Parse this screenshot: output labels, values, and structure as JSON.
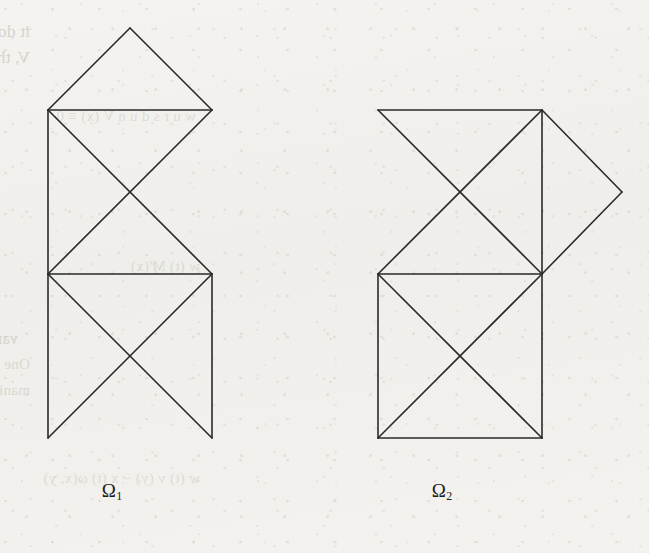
{
  "page": {
    "kind": "scanned-book-page",
    "width": 649,
    "height": 553,
    "paper_color": "#f2f1ee",
    "ink_color": "#2a2a2a",
    "bleedthrough_color": "#b9b5ad"
  },
  "figures": [
    {
      "id": "omega-1",
      "label": "Ω",
      "subscript": "1",
      "label_x": 112,
      "label_y": 480,
      "description": "Vertical strip of two stacked squares with X diagonals, capped by an upward triangle",
      "stroke": "#2a2a2a",
      "stroke_width": 1.6,
      "segments": [
        [
          130,
          28,
          48,
          110
        ],
        [
          130,
          28,
          212,
          110
        ],
        [
          48,
          110,
          212,
          110
        ],
        [
          48,
          110,
          48,
          274
        ],
        [
          48,
          110,
          212,
          274
        ],
        [
          212,
          110,
          48,
          274
        ],
        [
          48,
          274,
          212,
          274
        ],
        [
          48,
          274,
          48,
          438
        ],
        [
          212,
          274,
          212,
          438
        ],
        [
          48,
          274,
          212,
          438
        ],
        [
          212,
          274,
          48,
          438
        ]
      ]
    },
    {
      "id": "omega-2",
      "label": "Ω",
      "subscript": "2",
      "label_x": 442,
      "label_y": 480,
      "description": "Two stacked squares with X diagonals plus a diamond attached on the right of the upper square",
      "stroke": "#2a2a2a",
      "stroke_width": 1.6,
      "segments": [
        [
          378,
          110,
          542,
          110
        ],
        [
          378,
          110,
          542,
          274
        ],
        [
          542,
          110,
          378,
          274
        ],
        [
          542,
          110,
          542,
          274
        ],
        [
          378,
          274,
          542,
          274
        ],
        [
          542,
          110,
          622,
          192
        ],
        [
          622,
          192,
          542,
          274
        ],
        [
          378,
          274,
          378,
          438
        ],
        [
          542,
          274,
          542,
          438
        ],
        [
          378,
          438,
          542,
          438
        ],
        [
          378,
          274,
          542,
          438
        ],
        [
          542,
          274,
          378,
          438
        ]
      ]
    }
  ],
  "bleedthrough": {
    "note": "Faint mirrored show-through text from the reverse side of the sheet; not legible as content.",
    "lines": [
      {
        "text": "it does a bounded value the and its mapping will then",
        "x": 30,
        "y": 22,
        "size": 17,
        "opacity": 0.5
      },
      {
        "text": "V, then Dirichlet representation it then is son in I et",
        "x": 30,
        "y": 48,
        "size": 17,
        "opacity": 0.5
      },
      {
        "text": "w u r s     d u n     V  (x)     ≡     0",
        "x": 196,
        "y": 108,
        "size": 15,
        "opacity": 0.34
      },
      {
        "text": "w (t) M'(x)",
        "x": 200,
        "y": 258,
        "size": 15,
        "opacity": 0.34
      },
      {
        "text": "varies. So the the proceeds of and this the from the whe",
        "x": 18,
        "y": 330,
        "size": 16,
        "opacity": 0.44
      },
      {
        "text": "One can of every and comp are in the term in of case bene",
        "x": 30,
        "y": 356,
        "size": 15,
        "opacity": 0.4
      },
      {
        "text": "manifold Rand W  (x)  =  M  V(y) h",
        "x": 30,
        "y": 382,
        "size": 15,
        "opacity": 0.4
      },
      {
        "text": "w (t) v (y) − x (t) ω(x, y)",
        "x": 200,
        "y": 470,
        "size": 15,
        "opacity": 0.34
      }
    ]
  }
}
